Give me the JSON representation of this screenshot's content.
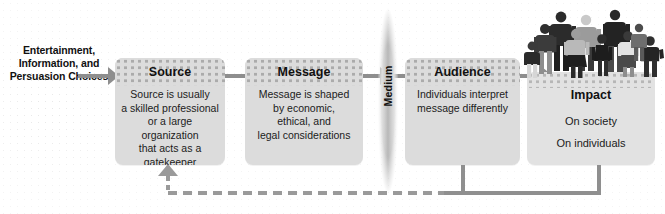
{
  "diagram": {
    "background_color": "#ffffff",
    "box_fill": "#dcdcdc",
    "arrow_color": "#8e8e8e",
    "feedback_color": "#9a9a9a"
  },
  "intro": {
    "lines": [
      "Entertainment,",
      "Information,",
      "and Persuasion",
      "Choices"
    ]
  },
  "stages": {
    "source": {
      "heading": "Source",
      "lines": [
        "Source is usually",
        "a skilled professional",
        "or a large organization",
        "that acts as a",
        "gatekeeper"
      ]
    },
    "message": {
      "heading": "Message",
      "lines": [
        "Message is shaped",
        "by economic,",
        "ethical, and",
        "legal considerations"
      ]
    },
    "medium": {
      "label": "Medium"
    },
    "audience": {
      "heading": "Audience",
      "lines": [
        "Individuals interpret",
        "message differently"
      ]
    },
    "impact": {
      "heading": "Impact",
      "lines": [
        "On society",
        "On individuals"
      ]
    }
  },
  "icons": {
    "intro_arrow": "arrow-right-icon",
    "source_to_message_arrow": "arrow-right-icon",
    "message_to_medium_arrow": "arrow-right-icon",
    "medium_to_audience_arrow": "arrow-right-icon",
    "audience_to_impact_arrow": "arrow-right-icon",
    "feedback_arrow": "arrow-up-icon",
    "people_group": "people-group-icon"
  }
}
